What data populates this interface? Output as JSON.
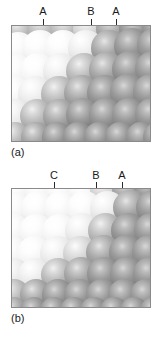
{
  "figure": {
    "type": "close-packed-layer-stacking-diagram",
    "background_color": "#ffffff",
    "border_color": "#8a8a8a",
    "leader_line_color": "#2b2b2b",
    "text_color": "#1a1a1a"
  },
  "panels": [
    {
      "id": "a",
      "caption": "(a)",
      "stacking_sequence": "ABA",
      "labels": [
        {
          "text": "A",
          "x": 43,
          "leader_x": 43,
          "leader_top": 19,
          "leader_height": 18
        },
        {
          "text": "B",
          "x": 91,
          "leader_x": 91,
          "leader_top": 19,
          "leader_height": 31
        },
        {
          "text": "A",
          "x": 116,
          "leader_x": 116,
          "leader_top": 19,
          "leader_height": 48
        }
      ]
    },
    {
      "id": "b",
      "caption": "(b)",
      "stacking_sequence": "ABC",
      "labels": [
        {
          "text": "C",
          "x": 54,
          "leader_x": 54,
          "leader_top": 18,
          "leader_height": 21
        },
        {
          "text": "B",
          "x": 96,
          "leader_x": 96,
          "leader_top": 18,
          "leader_height": 34
        },
        {
          "text": "A",
          "x": 122,
          "leader_x": 122,
          "leader_top": 18,
          "leader_height": 50
        }
      ]
    }
  ],
  "shading_scale": {
    "white": "#ffffff",
    "light": "#eaeaea",
    "mid": "#d4d4d4",
    "grey": "#bfbfbf",
    "dark": "#ababab",
    "darker": "#9c9c9c"
  },
  "atoms": {
    "panel_a": [
      {
        "x": -8,
        "y": -12,
        "d": 34,
        "sh": "sh-grey"
      },
      {
        "x": 15,
        "y": -14,
        "d": 34,
        "sh": "sh-grey"
      },
      {
        "x": 38,
        "y": -14,
        "d": 34,
        "sh": "sh-grey"
      },
      {
        "x": 61,
        "y": -14,
        "d": 34,
        "sh": "sh-mid"
      },
      {
        "x": 84,
        "y": -14,
        "d": 34,
        "sh": "sh-dark"
      },
      {
        "x": 107,
        "y": -14,
        "d": 34,
        "sh": "sh-darker"
      },
      {
        "x": 130,
        "y": -14,
        "d": 34,
        "sh": "sh-darker"
      },
      {
        "x": -12,
        "y": 6,
        "d": 36,
        "sh": "sh-white"
      },
      {
        "x": 10,
        "y": 4,
        "d": 36,
        "sh": "sh-white"
      },
      {
        "x": 33,
        "y": 4,
        "d": 36,
        "sh": "sh-white"
      },
      {
        "x": 56,
        "y": 4,
        "d": 36,
        "sh": "sh-light"
      },
      {
        "x": 79,
        "y": 4,
        "d": 36,
        "sh": "sh-dark"
      },
      {
        "x": 102,
        "y": 2,
        "d": 36,
        "sh": "sh-darker"
      },
      {
        "x": 125,
        "y": 2,
        "d": 36,
        "sh": "sh-darker"
      },
      {
        "x": -14,
        "y": 28,
        "d": 36,
        "sh": "sh-white"
      },
      {
        "x": 8,
        "y": 27,
        "d": 36,
        "sh": "sh-white"
      },
      {
        "x": 31,
        "y": 27,
        "d": 36,
        "sh": "sh-light"
      },
      {
        "x": 54,
        "y": 27,
        "d": 36,
        "sh": "sh-grey"
      },
      {
        "x": 77,
        "y": 26,
        "d": 36,
        "sh": "sh-dark"
      },
      {
        "x": 100,
        "y": 25,
        "d": 36,
        "sh": "sh-darker"
      },
      {
        "x": 123,
        "y": 25,
        "d": 36,
        "sh": "sh-darker"
      },
      {
        "x": -16,
        "y": 50,
        "d": 36,
        "sh": "sh-white"
      },
      {
        "x": 6,
        "y": 50,
        "d": 36,
        "sh": "sh-light"
      },
      {
        "x": 29,
        "y": 50,
        "d": 36,
        "sh": "sh-grey"
      },
      {
        "x": 52,
        "y": 49,
        "d": 36,
        "sh": "sh-dark"
      },
      {
        "x": 75,
        "y": 49,
        "d": 36,
        "sh": "sh-darker"
      },
      {
        "x": 98,
        "y": 48,
        "d": 36,
        "sh": "sh-darker"
      },
      {
        "x": 121,
        "y": 48,
        "d": 36,
        "sh": "sh-darker"
      },
      {
        "x": -14,
        "y": 73,
        "d": 34,
        "sh": "sh-light"
      },
      {
        "x": 8,
        "y": 73,
        "d": 34,
        "sh": "sh-grey"
      },
      {
        "x": 31,
        "y": 73,
        "d": 34,
        "sh": "sh-dark"
      },
      {
        "x": 54,
        "y": 72,
        "d": 34,
        "sh": "sh-darker"
      },
      {
        "x": 77,
        "y": 72,
        "d": 34,
        "sh": "sh-darker"
      },
      {
        "x": 100,
        "y": 72,
        "d": 34,
        "sh": "sh-darker"
      },
      {
        "x": 123,
        "y": 72,
        "d": 34,
        "sh": "sh-darker"
      },
      {
        "x": -12,
        "y": 96,
        "d": 30,
        "sh": "sh-grey"
      },
      {
        "x": 9,
        "y": 96,
        "d": 30,
        "sh": "sh-dark"
      },
      {
        "x": 30,
        "y": 96,
        "d": 30,
        "sh": "sh-darker"
      },
      {
        "x": 51,
        "y": 96,
        "d": 30,
        "sh": "sh-darker"
      },
      {
        "x": 72,
        "y": 96,
        "d": 30,
        "sh": "sh-darker"
      },
      {
        "x": 93,
        "y": 96,
        "d": 30,
        "sh": "sh-darker"
      },
      {
        "x": 114,
        "y": 96,
        "d": 30,
        "sh": "sh-darker"
      },
      {
        "x": 131,
        "y": 96,
        "d": 30,
        "sh": "sh-darker"
      }
    ],
    "panel_b": [
      {
        "x": -10,
        "y": -14,
        "d": 32,
        "sh": "sh-white"
      },
      {
        "x": 12,
        "y": -15,
        "d": 32,
        "sh": "sh-white"
      },
      {
        "x": 34,
        "y": -15,
        "d": 32,
        "sh": "sh-white"
      },
      {
        "x": 56,
        "y": -15,
        "d": 32,
        "sh": "sh-white"
      },
      {
        "x": 78,
        "y": -15,
        "d": 32,
        "sh": "sh-mid"
      },
      {
        "x": 100,
        "y": -15,
        "d": 32,
        "sh": "sh-dark"
      },
      {
        "x": 122,
        "y": -15,
        "d": 32,
        "sh": "sh-darker"
      },
      {
        "x": -14,
        "y": 3,
        "d": 35,
        "sh": "sh-white"
      },
      {
        "x": 9,
        "y": 2,
        "d": 35,
        "sh": "sh-white"
      },
      {
        "x": 32,
        "y": 2,
        "d": 35,
        "sh": "sh-white"
      },
      {
        "x": 55,
        "y": 2,
        "d": 35,
        "sh": "sh-white"
      },
      {
        "x": 78,
        "y": 2,
        "d": 35,
        "sh": "sh-light"
      },
      {
        "x": 101,
        "y": 1,
        "d": 35,
        "sh": "sh-dark"
      },
      {
        "x": 124,
        "y": 1,
        "d": 35,
        "sh": "sh-darker"
      },
      {
        "x": -16,
        "y": 25,
        "d": 35,
        "sh": "sh-white"
      },
      {
        "x": 7,
        "y": 25,
        "d": 35,
        "sh": "sh-white"
      },
      {
        "x": 30,
        "y": 25,
        "d": 35,
        "sh": "sh-white"
      },
      {
        "x": 53,
        "y": 24,
        "d": 35,
        "sh": "sh-light"
      },
      {
        "x": 76,
        "y": 24,
        "d": 35,
        "sh": "sh-grey"
      },
      {
        "x": 99,
        "y": 24,
        "d": 35,
        "sh": "sh-darker"
      },
      {
        "x": 122,
        "y": 24,
        "d": 35,
        "sh": "sh-darker"
      },
      {
        "x": -18,
        "y": 47,
        "d": 35,
        "sh": "sh-white"
      },
      {
        "x": 5,
        "y": 47,
        "d": 35,
        "sh": "sh-white"
      },
      {
        "x": 28,
        "y": 47,
        "d": 35,
        "sh": "sh-light"
      },
      {
        "x": 51,
        "y": 47,
        "d": 35,
        "sh": "sh-mid"
      },
      {
        "x": 74,
        "y": 46,
        "d": 35,
        "sh": "sh-dark"
      },
      {
        "x": 97,
        "y": 46,
        "d": 35,
        "sh": "sh-darker"
      },
      {
        "x": 120,
        "y": 46,
        "d": 35,
        "sh": "sh-darker"
      },
      {
        "x": -16,
        "y": 69,
        "d": 34,
        "sh": "sh-light"
      },
      {
        "x": 6,
        "y": 69,
        "d": 34,
        "sh": "sh-light"
      },
      {
        "x": 29,
        "y": 69,
        "d": 34,
        "sh": "sh-grey"
      },
      {
        "x": 52,
        "y": 68,
        "d": 34,
        "sh": "sh-dark"
      },
      {
        "x": 75,
        "y": 68,
        "d": 34,
        "sh": "sh-darker"
      },
      {
        "x": 98,
        "y": 68,
        "d": 34,
        "sh": "sh-darker"
      },
      {
        "x": 121,
        "y": 68,
        "d": 34,
        "sh": "sh-darker"
      },
      {
        "x": -14,
        "y": 90,
        "d": 32,
        "sh": "sh-grey"
      },
      {
        "x": 8,
        "y": 90,
        "d": 32,
        "sh": "sh-dark"
      },
      {
        "x": 30,
        "y": 90,
        "d": 32,
        "sh": "sh-darker"
      },
      {
        "x": 52,
        "y": 90,
        "d": 32,
        "sh": "sh-darker"
      },
      {
        "x": 74,
        "y": 90,
        "d": 32,
        "sh": "sh-darker"
      },
      {
        "x": 96,
        "y": 90,
        "d": 32,
        "sh": "sh-darker"
      },
      {
        "x": 118,
        "y": 90,
        "d": 32,
        "sh": "sh-darker"
      },
      {
        "x": -12,
        "y": 108,
        "d": 28,
        "sh": "sh-dark"
      },
      {
        "x": 8,
        "y": 108,
        "d": 28,
        "sh": "sh-darker"
      },
      {
        "x": 28,
        "y": 108,
        "d": 28,
        "sh": "sh-darker"
      },
      {
        "x": 48,
        "y": 108,
        "d": 28,
        "sh": "sh-darker"
      },
      {
        "x": 68,
        "y": 108,
        "d": 28,
        "sh": "sh-darker"
      },
      {
        "x": 88,
        "y": 108,
        "d": 28,
        "sh": "sh-darker"
      },
      {
        "x": 108,
        "y": 108,
        "d": 28,
        "sh": "sh-darker"
      },
      {
        "x": 128,
        "y": 108,
        "d": 28,
        "sh": "sh-darker"
      }
    ]
  }
}
